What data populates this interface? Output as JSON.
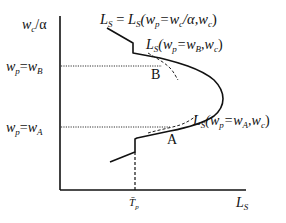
{
  "diagram": {
    "type": "economic-supply-curve",
    "y_axis": {
      "top_label": "w_c/α",
      "ticks": [
        {
          "id": "wB",
          "label": "w_p=w_B"
        },
        {
          "id": "wA",
          "label": "w_p=w_A"
        }
      ]
    },
    "x_axis": {
      "label": "L_S",
      "ticks": [
        {
          "id": "Tp",
          "label": "T̄_p"
        }
      ]
    },
    "curves": [
      {
        "id": "main",
        "label": "L_S = L_S(w_p=w_c/α, w_c)"
      },
      {
        "id": "tangentB",
        "label": "L_S(w_p=w_B, w_c)",
        "style": "dashed"
      },
      {
        "id": "tangentA",
        "label": "L_S(w_p=w_A, w_c)",
        "style": "dashed"
      }
    ],
    "points": [
      {
        "id": "B",
        "label": "B"
      },
      {
        "id": "A",
        "label": "A"
      }
    ],
    "labels": {
      "yTop": {
        "main": "w",
        "sub": "c",
        "rest": "/α"
      },
      "wB": {
        "w1": "w",
        "s1": "p",
        "eq": "=",
        "w2": "w",
        "s2": "B"
      },
      "wA": {
        "w1": "w",
        "s1": "p",
        "eq": "=",
        "w2": "w",
        "s2": "A"
      },
      "mainCurve": {
        "a": "L",
        "as": "S",
        "eq": " = ",
        "b": "L",
        "bs": "S",
        "open": "(w",
        "ps": "p",
        "mid": "=w",
        "cs": "c",
        "tail": "/α,w",
        "cs2": "c",
        "close": ")"
      },
      "curveB": {
        "a": "L",
        "as": "S",
        "open": "(w",
        "ps": "p",
        "mid": "=w",
        "bs": "B",
        "tail": ",w",
        "cs": "c",
        "close": ")"
      },
      "curveA": {
        "a": "L",
        "as": "S",
        "open": "(w",
        "ps": "p",
        "mid": "=w",
        "bs": "A",
        "tail": ",w",
        "cs": "c",
        "close": ")"
      },
      "xAxis": {
        "a": "L",
        "as": "S"
      },
      "tp": {
        "a": "T̄",
        "as": "p"
      },
      "pointB": "B",
      "pointA": "A"
    }
  }
}
